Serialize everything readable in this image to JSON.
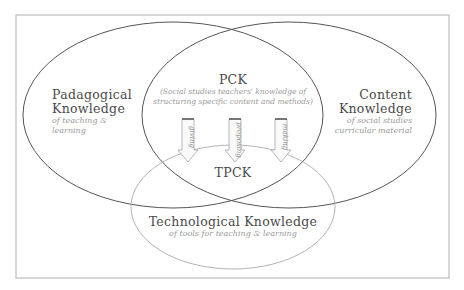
{
  "diagram": {
    "type": "venn",
    "circles": {
      "pedagogical": {
        "title_line1": "Padagogical",
        "title_line2": "Knowledge",
        "sub_line1": "of teaching &",
        "sub_line2": "learning"
      },
      "content": {
        "title_line1": "Content",
        "title_line2": "Knowledge",
        "sub_line1": "of social studies",
        "sub_line2": "curricular material"
      },
      "technological": {
        "title": "Technological Knowledge",
        "sub": "of tools for teaching & learning"
      }
    },
    "overlaps": {
      "pck": {
        "title": "PCK",
        "sub_line1": "(Social studies teachers' knowledge of",
        "sub_line2": "structuring specific content and methods)"
      },
      "tpck": {
        "title": "TPCK"
      }
    },
    "arrows": [
      {
        "label": "giving"
      },
      {
        "label": "proposing"
      },
      {
        "label": "making"
      }
    ],
    "colors": {
      "frame": "#b8b8b8",
      "main_ellipse_stroke": "#555555",
      "tech_ellipse_stroke": "#aaaaaa",
      "title_text": "#4a4a4a",
      "sub_text": "#9a9a9a"
    }
  }
}
